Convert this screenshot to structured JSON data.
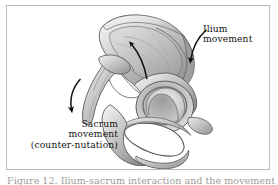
{
  "figure": {
    "frame_border_color": "#b9b9b9",
    "background_color": "#ffffff",
    "illustration_name": "pelvis-sacrum-counter-nutation-illustration",
    "caption": "Figure 12. Ilium-sacrum interaction and the movements associated",
    "labels": {
      "ilium": {
        "line1": "Ilium",
        "line2": "movement"
      },
      "sacrum": {
        "line1": "Sacrum",
        "line2": "movement",
        "line3": "(counter-nutation)"
      }
    },
    "arrows": {
      "ilium_arrow": "curved-arrow-down-left",
      "sacrum_arrow": "curved-arrow-down-left",
      "iliac_fossa_arrow": "straight-arrow-up-left"
    },
    "colors": {
      "bone_light": "#e3e3e3",
      "bone_mid": "#b6b6b6",
      "bone_dark": "#8c8c8c",
      "bone_shadow": "#6f6f6f",
      "outline": "#4b4b4b",
      "arrow": "#111111",
      "text": "#141414"
    }
  }
}
